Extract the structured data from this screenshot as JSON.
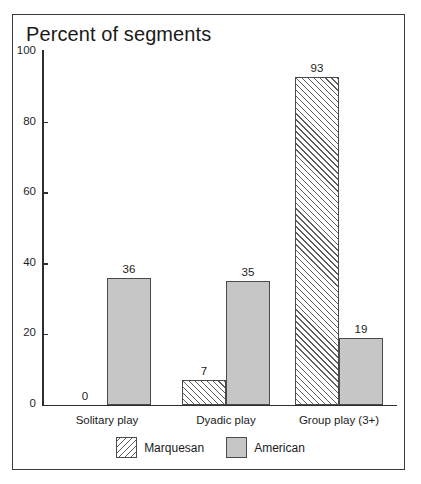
{
  "chart_data": {
    "type": "bar",
    "title": "Percent of segments",
    "xlabel": "",
    "ylabel": "",
    "ylim": [
      0,
      100
    ],
    "yticks": [
      0,
      20,
      40,
      60,
      80,
      100
    ],
    "ytick_labels": [
      "0",
      "20",
      "40",
      "60",
      "80",
      "100"
    ],
    "grid": false,
    "legend_position": "bottom-center",
    "categories": [
      "Solitary play",
      "Dyadic play",
      "Group play (3+)"
    ],
    "series": [
      {
        "name": "Marquesan",
        "fill": "diagonal-hatch",
        "color": "#ffffff",
        "values": [
          0,
          7,
          93
        ],
        "value_labels": [
          "0",
          "7",
          "93"
        ]
      },
      {
        "name": "American",
        "fill": "solid-gray",
        "color": "#c6c6c6",
        "values": [
          36,
          35,
          19
        ],
        "value_labels": [
          "36",
          "35",
          "19"
        ]
      }
    ]
  },
  "legend": {
    "entries": [
      {
        "label": "Marquesan",
        "swatch": "hatch-swatch-icon"
      },
      {
        "label": "American",
        "swatch": "gray-swatch-icon"
      }
    ]
  }
}
